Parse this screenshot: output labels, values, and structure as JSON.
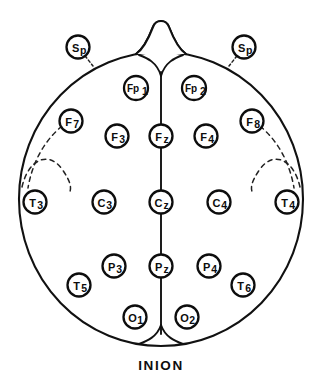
{
  "figure": {
    "view": "top-down head schematic, nose at top, inion at bottom",
    "background_color": "#ffffff",
    "ink_color": "#0d0d0d"
  },
  "head": {
    "outline_shape": "ellipse",
    "center_x": 161,
    "center_y": 199,
    "radius_x": 142,
    "radius_y": 147,
    "nose_present": true,
    "nose_label": "nose",
    "nasion_fork_present": true,
    "inion_fork_present": true
  },
  "midline": {
    "label": "sagittal midline",
    "top_y": 62,
    "bottom_y": 338,
    "x": 161
  },
  "fissures": {
    "label": "sylvian fissure dashed arcs",
    "count": 4,
    "side_left": 2,
    "side_right": 2
  },
  "bottom_label": {
    "text": "INION",
    "x": 161,
    "y": 365
  },
  "electrodes": [
    {
      "id": "Sp-left",
      "name": "Sp",
      "main": "S",
      "sub": "p",
      "x": 78,
      "y": 47,
      "r": 11.5,
      "outside_head": true,
      "leader": true,
      "leader_to_x": 93,
      "leader_to_y": 66
    },
    {
      "id": "Sp-right",
      "name": "Sp",
      "main": "S",
      "sub": "p",
      "x": 244,
      "y": 47,
      "r": 11.5,
      "outside_head": true,
      "leader": true,
      "leader_to_x": 229,
      "leader_to_y": 66
    },
    {
      "id": "Fp1",
      "name": "Fp1",
      "main": "Fp",
      "sub": "1",
      "x": 136,
      "y": 88,
      "r": 12.0,
      "outside_head": false,
      "leader": false
    },
    {
      "id": "Fp2",
      "name": "Fp2",
      "main": "Fp",
      "sub": "2",
      "x": 194,
      "y": 88,
      "r": 12.0,
      "outside_head": false,
      "leader": false
    },
    {
      "id": "F7",
      "name": "F7",
      "main": "F",
      "sub": "7",
      "x": 71,
      "y": 121,
      "r": 11.5,
      "outside_head": false,
      "leader": false
    },
    {
      "id": "F8",
      "name": "F8",
      "main": "F",
      "sub": "8",
      "x": 252,
      "y": 121,
      "r": 11.5,
      "outside_head": false,
      "leader": false
    },
    {
      "id": "F3",
      "name": "F3",
      "main": "F",
      "sub": "3",
      "x": 117,
      "y": 136,
      "r": 11.5,
      "outside_head": false,
      "leader": false
    },
    {
      "id": "Fz",
      "name": "Fz",
      "main": "F",
      "sub": "z",
      "x": 161,
      "y": 136,
      "r": 11.5,
      "outside_head": false,
      "leader": false
    },
    {
      "id": "F4",
      "name": "F4",
      "main": "F",
      "sub": "4",
      "x": 206,
      "y": 136,
      "r": 11.5,
      "outside_head": false,
      "leader": false
    },
    {
      "id": "T3",
      "name": "T3",
      "main": "T",
      "sub": "3",
      "x": 35,
      "y": 202,
      "r": 11.5,
      "outside_head": false,
      "leader": false
    },
    {
      "id": "C3",
      "name": "C3",
      "main": "C",
      "sub": "3",
      "x": 104,
      "y": 202,
      "r": 11.5,
      "outside_head": false,
      "leader": false
    },
    {
      "id": "Cz",
      "name": "Cz",
      "main": "C",
      "sub": "z",
      "x": 161,
      "y": 202,
      "r": 11.5,
      "outside_head": false,
      "leader": false
    },
    {
      "id": "C4",
      "name": "C4",
      "main": "C",
      "sub": "4",
      "x": 219,
      "y": 202,
      "r": 11.5,
      "outside_head": false,
      "leader": false
    },
    {
      "id": "T4",
      "name": "T4",
      "main": "T",
      "sub": "4",
      "x": 287,
      "y": 202,
      "r": 11.5,
      "outside_head": false,
      "leader": false
    },
    {
      "id": "P3",
      "name": "P3",
      "main": "P",
      "sub": "3",
      "x": 114,
      "y": 266,
      "r": 11.5,
      "outside_head": false,
      "leader": false
    },
    {
      "id": "Pz",
      "name": "Pz",
      "main": "P",
      "sub": "z",
      "x": 161,
      "y": 266,
      "r": 11.5,
      "outside_head": false,
      "leader": false
    },
    {
      "id": "P4",
      "name": "P4",
      "main": "P",
      "sub": "4",
      "x": 209,
      "y": 266,
      "r": 11.5,
      "outside_head": false,
      "leader": false
    },
    {
      "id": "T5",
      "name": "T5",
      "main": "T",
      "sub": "5",
      "x": 79,
      "y": 285,
      "r": 11.5,
      "outside_head": false,
      "leader": false
    },
    {
      "id": "T6",
      "name": "T6",
      "main": "T",
      "sub": "6",
      "x": 243,
      "y": 285,
      "r": 11.5,
      "outside_head": false,
      "leader": false
    },
    {
      "id": "O1",
      "name": "O1",
      "main": "O",
      "sub": "1",
      "x": 135,
      "y": 317,
      "r": 11.5,
      "outside_head": false,
      "leader": false
    },
    {
      "id": "O2",
      "name": "O2",
      "main": "O",
      "sub": "2",
      "x": 187,
      "y": 317,
      "r": 11.5,
      "outside_head": false,
      "leader": false
    }
  ]
}
